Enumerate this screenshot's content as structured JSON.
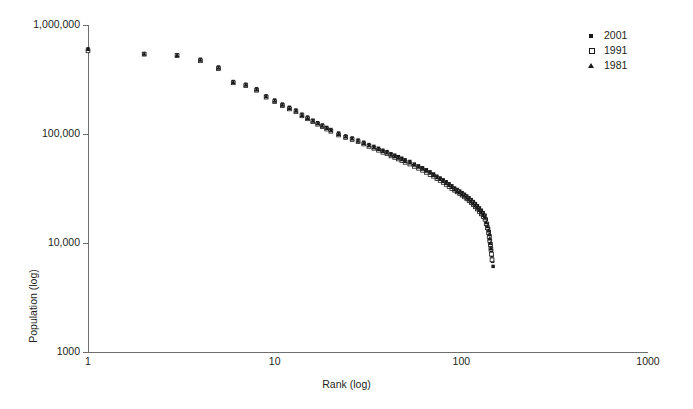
{
  "chart_data": {
    "type": "scatter",
    "title": "",
    "xlabel": "Rank (log)",
    "ylabel": "Population (log)",
    "xscale": "log",
    "yscale": "log",
    "xlim": [
      1,
      1000
    ],
    "ylim": [
      1000,
      1000000
    ],
    "xticks": [
      "1",
      "10",
      "100",
      "1000"
    ],
    "yticks": [
      "1,000,000",
      "100,000",
      "10,000",
      "1000"
    ],
    "grid": false,
    "legend_position": "top-right",
    "series": [
      {
        "name": "2001",
        "marker": "filled-square",
        "color": "#1a1a1a",
        "x": [
          1,
          2,
          3,
          4,
          5,
          6,
          7,
          8,
          9,
          10,
          11,
          12,
          13,
          14,
          15,
          16,
          17,
          18,
          19,
          20,
          22,
          24,
          26,
          28,
          30,
          32,
          34,
          36,
          38,
          40,
          42,
          44,
          46,
          48,
          50,
          53,
          56,
          59,
          62,
          65,
          68,
          71,
          74,
          77,
          80,
          83,
          86,
          89,
          92,
          95,
          98,
          101,
          104,
          107,
          110,
          113,
          116,
          119,
          122,
          125,
          128,
          131,
          134,
          136,
          138,
          140,
          141,
          142,
          143,
          144,
          145,
          146,
          147,
          148
        ],
        "y": [
          604000,
          547000,
          533000,
          485000,
          412000,
          303000,
          286000,
          260000,
          224000,
          205000,
          188000,
          176000,
          166000,
          152000,
          143000,
          134000,
          127000,
          121000,
          115000,
          110000,
          102000,
          96000,
          92000,
          88000,
          84000,
          80000,
          77000,
          74000,
          71000,
          69000,
          66000,
          64000,
          62000,
          60000,
          58000,
          56000,
          53000,
          51000,
          49000,
          47000,
          45000,
          43000,
          41000,
          39500,
          38000,
          36500,
          35000,
          33500,
          32000,
          31000,
          30000,
          29000,
          28000,
          27000,
          26000,
          25000,
          24000,
          23000,
          22000,
          21000,
          20000,
          19000,
          18000,
          16500,
          15000,
          13500,
          12500,
          11500,
          10500,
          9500,
          8500,
          7600,
          6800,
          6100
        ]
      },
      {
        "name": "1991",
        "marker": "open-square",
        "color": "#1a1a1a",
        "x": [
          1,
          2,
          3,
          4,
          5,
          6,
          7,
          8,
          9,
          10,
          11,
          12,
          13,
          14,
          15,
          16,
          17,
          18,
          19,
          20,
          22,
          24,
          26,
          28,
          30,
          32,
          34,
          36,
          38,
          40,
          42,
          44,
          46,
          48,
          50,
          53,
          56,
          59,
          62,
          65,
          68,
          71,
          74,
          77,
          80,
          83,
          86,
          89,
          92,
          95,
          98,
          101,
          104,
          107,
          110,
          113,
          116,
          119,
          122,
          125,
          128,
          131,
          134,
          136,
          138,
          140,
          141,
          142,
          143,
          144,
          145,
          146
        ],
        "y": [
          580000,
          540000,
          525000,
          470000,
          398000,
          295000,
          278000,
          252000,
          218000,
          198000,
          182000,
          170000,
          160000,
          147000,
          138000,
          130000,
          123000,
          117000,
          111000,
          106000,
          98000,
          93000,
          89000,
          85000,
          81000,
          77000,
          74000,
          71000,
          68000,
          66000,
          63000,
          61000,
          59000,
          57000,
          55000,
          53000,
          50500,
          48500,
          46500,
          44500,
          42500,
          41000,
          39000,
          37500,
          36000,
          34500,
          33000,
          31500,
          30500,
          29500,
          28500,
          27500,
          26500,
          25500,
          24500,
          23500,
          22500,
          21500,
          20500,
          19500,
          18500,
          17500,
          16500,
          15000,
          13800,
          12500,
          11500,
          10500,
          9700,
          8800,
          7900,
          7000
        ]
      },
      {
        "name": "1981",
        "marker": "filled-triangle",
        "color": "#1a1a1a",
        "x": [
          1,
          2,
          3,
          4,
          5,
          6,
          7,
          8,
          9,
          10,
          11,
          12,
          13,
          14,
          15,
          16,
          17,
          18,
          19,
          20,
          22,
          24,
          26,
          28,
          30,
          32,
          34,
          36,
          38,
          40,
          42,
          44,
          46,
          48,
          50,
          53,
          56,
          59,
          62,
          65,
          68,
          71,
          74,
          77,
          80,
          83,
          86,
          89,
          92,
          95,
          98,
          101,
          104,
          107,
          110,
          113,
          116,
          119,
          122,
          125,
          128,
          131,
          134,
          136,
          138,
          140,
          141,
          142,
          143,
          144
        ],
        "y": [
          600000,
          544000,
          530000,
          478000,
          405000,
          299000,
          282000,
          256000,
          221000,
          201000,
          185000,
          173000,
          163000,
          149000,
          140000,
          132000,
          125000,
          119000,
          113000,
          108000,
          100000,
          94500,
          90500,
          86500,
          82500,
          78500,
          75500,
          72500,
          69500,
          67500,
          64500,
          62500,
          60500,
          58500,
          56500,
          54500,
          52000,
          50000,
          48000,
          46000,
          44000,
          42000,
          40000,
          38500,
          37000,
          35500,
          34000,
          32500,
          31000,
          30000,
          29000,
          28000,
          27000,
          26000,
          25000,
          24000,
          23000,
          22000,
          21000,
          20000,
          19000,
          18000,
          17000,
          15500,
          14200,
          13000,
          12000,
          11000,
          10000,
          9000
        ]
      }
    ]
  },
  "legend": {
    "items": [
      {
        "label": "2001",
        "marker": "filled-square"
      },
      {
        "label": "1991",
        "marker": "open-square"
      },
      {
        "label": "1981",
        "marker": "filled-triangle"
      }
    ]
  }
}
